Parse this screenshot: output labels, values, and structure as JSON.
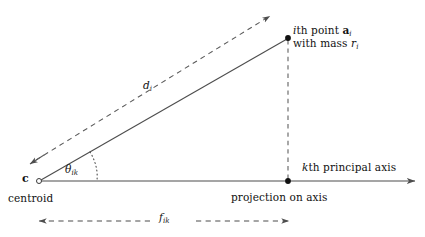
{
  "figure": {
    "kind": "geometry-diagram",
    "title": "",
    "background_color": "#ffffff",
    "line_color": "#4d4d4d",
    "text_color": "#111111"
  },
  "labels": {
    "point_line1_prefix": "i",
    "point_line1_mid": "th point ",
    "point_line1_vector": "a",
    "point_line1_sub": "i",
    "point_line2_text": "with mass ",
    "point_line2_var": "r",
    "point_line2_sub": "i",
    "distance_var": "d",
    "distance_sub": "i",
    "angle_var": "θ",
    "angle_sub": "ik",
    "centroid_symbol": "c",
    "centroid_text": "centroid",
    "axis_prefix": "k",
    "axis_text": "th principal axis",
    "projection_text": "projection on axis",
    "dimension_var": "f",
    "dimension_sub": "ik"
  },
  "geometry": {
    "centroid_point": [
      39,
      181
    ],
    "data_point": [
      288,
      38
    ],
    "projection_point": [
      288,
      181
    ],
    "axis_start": [
      39,
      181
    ],
    "axis_end": [
      418,
      181
    ],
    "direction_arrow_start": [
      31,
      163
    ],
    "direction_arrow_end": [
      272,
      14
    ],
    "dimension_line_y": 221,
    "dimension_left_x": 33,
    "dimension_right_x": 290
  },
  "markers": {
    "centroid_marker": "open-circle",
    "data_point_marker": "filled-dot",
    "projection_marker": "filled-dot"
  },
  "strokes": {
    "solid": "solid",
    "ray_to_point": "solid",
    "direction_line": "dashed",
    "projection_drop": "dashed",
    "angle_arc": "dotted",
    "dimension_line": "dashed"
  }
}
